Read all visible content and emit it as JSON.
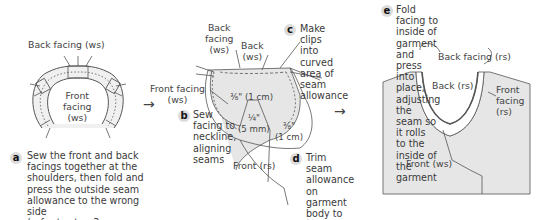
{
  "panels": {
    "a": {
      "badge": "a",
      "labels": {
        "back_facing": "Back facing (ws)",
        "front_facing": "Front\nfacing\n(ws)"
      },
      "instruction": "Sew the front and back\nfacings together at the\nshoulders, then fold and\npress the outside seam\nallowance to the wrong side\n(refer to step 3 on page 68)"
    },
    "b": {
      "badge": "b",
      "labels": {
        "back_facing": "Back\nfacing\n(ws)",
        "back": "Back\n(ws)",
        "front_facing": "Front facing\n(ws)",
        "seam_3_8": "⅜\" (1 cm)",
        "seam_1_4": "¼\"\n(5 mm)",
        "seam_3_8_b": "⅜\"\n(1 cm)",
        "front": "Front (rs)"
      },
      "instruction": "Sew\nfacing to\nneckline,\naligning\nseams"
    },
    "c": {
      "badge": "c",
      "instruction": "Make clips\ninto curved\narea of seam\nallowance"
    },
    "d": {
      "badge": "d",
      "instruction": "Trim seam\nallowance\non garment\nbody to ¼\"\n(5 mm)"
    },
    "e": {
      "badge": "e",
      "instruction": "Fold facing to inside of\ngarment and press into place,\nadjusting the seam so it rolls\nto the inside of the garment",
      "labels": {
        "back_facing": "Back facing (rs)",
        "back": "Back (rs)",
        "front_facing": "Front\nfacing\n(rs)",
        "front": "Front (ws)"
      }
    }
  },
  "arrows": [
    "→",
    "→"
  ],
  "colors": {
    "fabric": "#e6e6e6",
    "line": "#555555",
    "badge_bg": "#dcdcdc",
    "text": "#3a3a3a"
  }
}
